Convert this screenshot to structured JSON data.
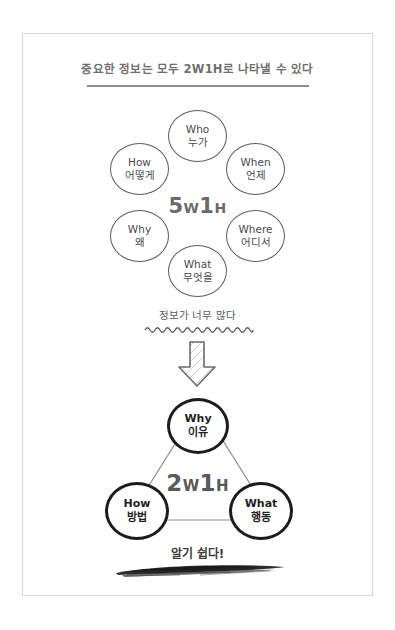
{
  "page": {
    "title": "중요한 정보는 모두 2W1H로 나타낼 수 있다"
  },
  "colors": {
    "frame": "#d8d8d8",
    "title_text": "#6f6f6f",
    "thin_circle_stroke": "#5d5d5d",
    "thick_circle_stroke": "#1c1c1c",
    "center_label": "#5a5a5a",
    "brush_stroke": "#1a1a1a"
  },
  "top_diagram": {
    "center_label": {
      "digit": "5",
      "w": "W",
      "one": "1",
      "h": "H",
      "full": "5W1H"
    },
    "circles": [
      {
        "en": "Who",
        "ko": "누가",
        "position": "top"
      },
      {
        "en": "When",
        "ko": "언제",
        "position": "top-right"
      },
      {
        "en": "Where",
        "ko": "어디서",
        "position": "bottom-right"
      },
      {
        "en": "What",
        "ko": "무엇을",
        "position": "bottom"
      },
      {
        "en": "Why",
        "ko": "왜",
        "position": "bottom-left"
      },
      {
        "en": "How",
        "ko": "어떻게",
        "position": "top-left"
      }
    ]
  },
  "transition": {
    "caption": "정보가 너무 많다",
    "wave_icon": "wavy-underline-icon",
    "arrow_icon": "down-arrow-icon"
  },
  "bottom_diagram": {
    "center_label": {
      "digit": "2",
      "w": "W",
      "one": "1",
      "h": "H",
      "full": "2W1H"
    },
    "circles": [
      {
        "en": "Why",
        "ko": "이유",
        "position": "top"
      },
      {
        "en": "How",
        "ko": "방법",
        "position": "bottom-left"
      },
      {
        "en": "What",
        "ko": "행동",
        "position": "bottom-right"
      }
    ]
  },
  "footer": {
    "caption": "알기 쉽다!",
    "brush_icon": "brush-stroke-underline-icon"
  }
}
